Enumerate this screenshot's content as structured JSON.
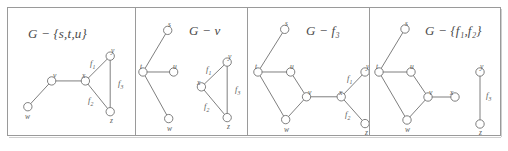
{
  "figure": {
    "kind": "graph-theory-figure",
    "panel_count": 4,
    "edge_color": "#6f6f6f",
    "node_stroke_color": "#6f6f6f",
    "node_fill_color": "#ffffff",
    "border_color": "#9a9a9a",
    "text_color": "#4a4a4a"
  },
  "panels": [
    {
      "title": "G − {s,t,u}",
      "title_plain": "G - {s,t,u}",
      "removed": [
        "s",
        "t",
        "u"
      ],
      "vertices": [
        {
          "id": "w",
          "label": "w",
          "x": 20,
          "y": 99
        },
        {
          "id": "v",
          "label": "v",
          "x": 44,
          "y": 73
        },
        {
          "id": "x",
          "label": "x",
          "x": 78,
          "y": 73
        },
        {
          "id": "y",
          "label": "y",
          "x": 103,
          "y": 48
        },
        {
          "id": "z",
          "label": "z",
          "x": 103,
          "y": 104
        }
      ],
      "edges": [
        {
          "from": "w",
          "to": "v"
        },
        {
          "from": "v",
          "to": "x"
        },
        {
          "from": "x",
          "to": "y"
        },
        {
          "from": "x",
          "to": "z"
        },
        {
          "from": "y",
          "to": "z"
        }
      ],
      "face_labels": [
        {
          "id": "f1",
          "label": "f",
          "subscript": "1",
          "x": 82,
          "y": 55
        },
        {
          "id": "f2",
          "label": "f",
          "subscript": "2",
          "x": 81,
          "y": 92
        },
        {
          "id": "f3",
          "label": "f",
          "subscript": "3",
          "x": 111,
          "y": 76
        }
      ]
    },
    {
      "title": "G − v",
      "title_plain": "G - v",
      "removed": [
        "v"
      ],
      "vertices": [
        {
          "id": "s",
          "label": "s",
          "x": 32,
          "y": 22
        },
        {
          "id": "t",
          "label": "t",
          "x": 7,
          "y": 64
        },
        {
          "id": "u",
          "label": "u",
          "x": 38,
          "y": 64
        },
        {
          "id": "w",
          "label": "w",
          "x": 33,
          "y": 111
        },
        {
          "id": "x",
          "label": "x",
          "x": 66,
          "y": 79
        },
        {
          "id": "y",
          "label": "y",
          "x": 92,
          "y": 54
        },
        {
          "id": "z",
          "label": "z",
          "x": 92,
          "y": 110
        }
      ],
      "edges": [
        {
          "from": "t",
          "to": "s"
        },
        {
          "from": "t",
          "to": "u"
        },
        {
          "from": "t",
          "to": "w"
        },
        {
          "from": "x",
          "to": "y"
        },
        {
          "from": "x",
          "to": "z"
        },
        {
          "from": "y",
          "to": "z"
        }
      ],
      "face_labels": [
        {
          "id": "f1",
          "label": "f",
          "subscript": "1",
          "x": 70,
          "y": 61
        },
        {
          "id": "f2",
          "label": "f",
          "subscript": "2",
          "x": 69,
          "y": 98
        },
        {
          "id": "f3",
          "label": "f",
          "subscript": "3",
          "x": 100,
          "y": 82
        }
      ]
    },
    {
      "title": "G − f₃",
      "title_plain": "G - f3",
      "removed": [
        "f3"
      ],
      "vertices": [
        {
          "id": "s",
          "label": "s",
          "x": 37,
          "y": 21
        },
        {
          "id": "t",
          "label": "t",
          "x": 10,
          "y": 64
        },
        {
          "id": "u",
          "label": "u",
          "x": 43,
          "y": 64
        },
        {
          "id": "v",
          "label": "v",
          "x": 59,
          "y": 89
        },
        {
          "id": "w",
          "label": "w",
          "x": 38,
          "y": 112
        },
        {
          "id": "x",
          "label": "x",
          "x": 94,
          "y": 89
        },
        {
          "id": "y",
          "label": "y",
          "x": 118,
          "y": 64
        },
        {
          "id": "z",
          "label": "z",
          "x": 118,
          "y": 116
        }
      ],
      "edges": [
        {
          "from": "t",
          "to": "s"
        },
        {
          "from": "t",
          "to": "u"
        },
        {
          "from": "t",
          "to": "w"
        },
        {
          "from": "u",
          "to": "v"
        },
        {
          "from": "v",
          "to": "w"
        },
        {
          "from": "v",
          "to": "x"
        },
        {
          "from": "x",
          "to": "y"
        },
        {
          "from": "x",
          "to": "z"
        }
      ],
      "face_labels": [
        {
          "id": "f1",
          "label": "f",
          "subscript": "1",
          "x": 99,
          "y": 70
        },
        {
          "id": "f2",
          "label": "f",
          "subscript": "2",
          "x": 98,
          "y": 106
        }
      ]
    },
    {
      "title": "G − {f₁,f₂}",
      "title_plain": "G - {f1,f2}",
      "removed": [
        "f1",
        "f2"
      ],
      "vertices": [
        {
          "id": "s",
          "label": "s",
          "x": 35,
          "y": 21
        },
        {
          "id": "t",
          "label": "t",
          "x": 9,
          "y": 64
        },
        {
          "id": "u",
          "label": "u",
          "x": 41,
          "y": 64
        },
        {
          "id": "v",
          "label": "v",
          "x": 58,
          "y": 89
        },
        {
          "id": "w",
          "label": "w",
          "x": 37,
          "y": 112
        },
        {
          "id": "x",
          "label": "x",
          "x": 85,
          "y": 89
        },
        {
          "id": "y",
          "label": "y",
          "x": 110,
          "y": 64
        },
        {
          "id": "z",
          "label": "z",
          "x": 110,
          "y": 116
        }
      ],
      "edges": [
        {
          "from": "t",
          "to": "s"
        },
        {
          "from": "t",
          "to": "u"
        },
        {
          "from": "t",
          "to": "w"
        },
        {
          "from": "u",
          "to": "v"
        },
        {
          "from": "v",
          "to": "w"
        },
        {
          "from": "v",
          "to": "x"
        },
        {
          "from": "y",
          "to": "z"
        }
      ],
      "face_labels": [
        {
          "id": "f3",
          "label": "f",
          "subscript": "3",
          "x": 117,
          "y": 88
        }
      ]
    }
  ]
}
